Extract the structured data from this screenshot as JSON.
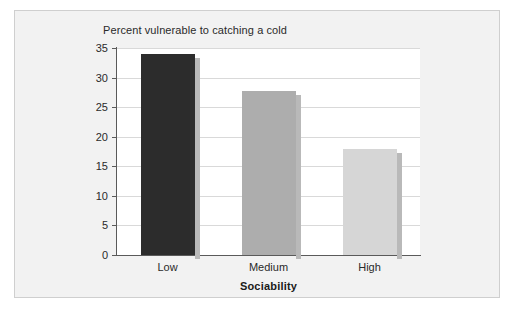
{
  "chart_data": {
    "type": "bar",
    "title": "Percent vulnerable to catching a cold",
    "xlabel": "Sociability",
    "ylabel": "",
    "categories": [
      "Low",
      "Medium",
      "High"
    ],
    "values": [
      34,
      27.8,
      18
    ],
    "series": [
      {
        "name": "Percent vulnerable to catching a cold",
        "values": [
          34,
          27.8,
          18
        ]
      }
    ],
    "ylim": [
      0,
      35
    ],
    "y_ticks": [
      0,
      5,
      10,
      15,
      20,
      25,
      30,
      35
    ],
    "y_tick_labels": [
      "0",
      "5",
      "10",
      "15",
      "20",
      "25",
      "30",
      "35"
    ],
    "grid": true,
    "legend": false,
    "legend_position": "none",
    "bar_colors": [
      "#2c2c2c",
      "#adadad",
      "#d6d6d6"
    ],
    "shadow_color": "#b9b9b9",
    "gridline_color": "#d9d9d9",
    "axis_color": "#5a5a5a",
    "plot_background": "#ffffff",
    "figure_background": "#f2f2f2",
    "frame_color": "#cfcfcf",
    "text_color": "#2a2a2a"
  }
}
